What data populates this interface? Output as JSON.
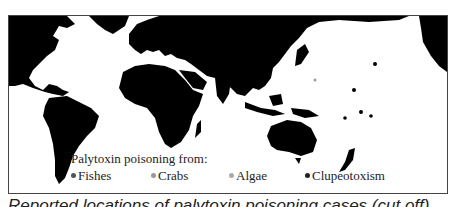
{
  "figure": {
    "legend": {
      "title": "Palytoxin poisoning from:",
      "items": [
        {
          "label": "Fishes",
          "color": "#555555"
        },
        {
          "label": "Crabs",
          "color": "#999999"
        },
        {
          "label": "Algae",
          "color": "#aaaaaa"
        },
        {
          "label": "Clupeotoxism",
          "color": "#222222"
        }
      ]
    },
    "caption": "Reported locations of palytoxin poisoning cases (cut off)",
    "colors": {
      "land": "#000000",
      "sea": "#ffffff",
      "frame": "#444444"
    }
  }
}
